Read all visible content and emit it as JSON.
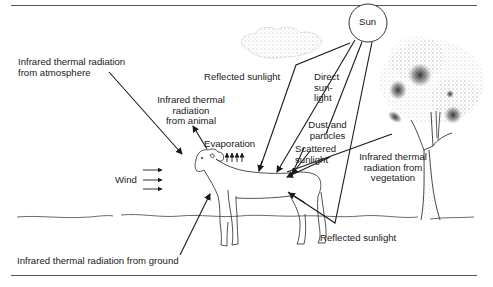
{
  "diagram": {
    "type": "heat exchange between an animal (sheep) and its environment",
    "labels": {
      "sun": "Sun",
      "ir_atmosphere": [
        "Infrared thermal radiation",
        "from atmosphere"
      ],
      "ir_animal": [
        "Infrared thermal",
        "radiation",
        "from animal"
      ],
      "reflected_sky": "Reflected sunlight",
      "direct": [
        "Direct",
        "sun-",
        "light"
      ],
      "dust": [
        "Dust and",
        "particles"
      ],
      "scattered": [
        "Scattered",
        "sunlight"
      ],
      "evaporation": "Evaporation",
      "wind": "Wind",
      "ir_vegetation": [
        "Infrared thermal",
        "radiation from",
        "vegetation"
      ],
      "reflected_ground": "Reflected sunlight",
      "ir_ground": "Infrared thermal radiation from ground"
    },
    "elements": [
      "sun",
      "cloud",
      "tree",
      "sheep",
      "ground-line",
      "wind-arrows",
      "evaporation-arrows"
    ],
    "colors": {
      "ink": "#1a1a1a",
      "rule": "#555555",
      "background": "#ffffff"
    }
  }
}
